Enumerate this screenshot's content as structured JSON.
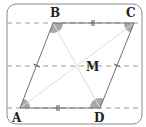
{
  "diagram": {
    "type": "geometry",
    "points": {
      "A": {
        "label": "A",
        "x": 20,
        "y": 108
      },
      "B": {
        "label": "B",
        "x": 53,
        "y": 23
      },
      "C": {
        "label": "C",
        "x": 134,
        "y": 23
      },
      "D": {
        "label": "D",
        "x": 100,
        "y": 108
      },
      "M": {
        "label": "M",
        "x": 77,
        "y": 65.5
      }
    },
    "dashed_lines_y": [
      23,
      66,
      108
    ],
    "equal_marks": {
      "single_tick_sides": [
        "AB",
        "CD"
      ],
      "double_tick_sides": [
        "BC",
        "AD"
      ]
    },
    "angle_markers": [
      "A",
      "B",
      "C",
      "D"
    ],
    "colors": {
      "frame": "#8a8a8a",
      "sides": "#6e6e6e",
      "dashed": "#9a9a9a",
      "diagonals": "#dddddd",
      "angle_fill": "#a8a8a8",
      "text": "#222222"
    }
  }
}
